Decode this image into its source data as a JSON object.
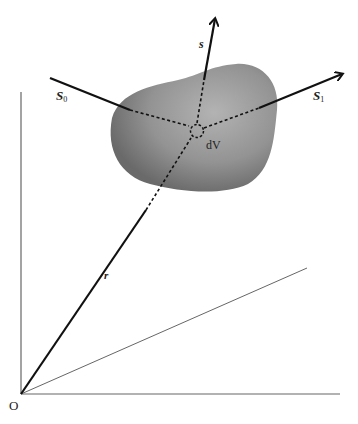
{
  "diagram": {
    "labels": {
      "origin": "O",
      "position_vector": "r",
      "direction": "s",
      "source_point_main": "S",
      "source_point_sub": "0",
      "exit_point_main": "S",
      "exit_point_sub": "1",
      "volume_element": "dV"
    },
    "colors": {
      "blob_light": "#a9a9a9",
      "blob_dark": "#6e6e6e",
      "line": "#111111",
      "axis": "#555555"
    }
  }
}
